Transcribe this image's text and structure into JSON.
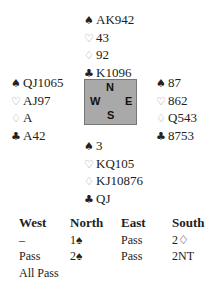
{
  "deal": {
    "north": {
      "spades": "AK942",
      "hearts": "43",
      "diamonds": "92",
      "clubs": "K1096"
    },
    "west": {
      "spades": "QJ1065",
      "hearts": "AJ97",
      "diamonds": "A",
      "clubs": "A42"
    },
    "east": {
      "spades": "87",
      "hearts": "862",
      "diamonds": "Q543",
      "clubs": "8753"
    },
    "south": {
      "spades": "3",
      "hearts": "KQ105",
      "diamonds": "KJ10876",
      "clubs": "QJ"
    }
  },
  "symbols": {
    "spades": "♠",
    "hearts": "♡",
    "diamonds": "♢",
    "clubs": "♣"
  },
  "compass": {
    "n": "N",
    "s": "S",
    "e": "E",
    "w": "W"
  },
  "auction": {
    "headers": [
      "West",
      "North",
      "East",
      "South"
    ],
    "rows": [
      [
        "–",
        "1♠",
        "Pass",
        "2♢"
      ],
      [
        "Pass",
        "2♠",
        "Pass",
        "2NT"
      ],
      [
        "All Pass",
        "",
        "",
        ""
      ]
    ]
  }
}
